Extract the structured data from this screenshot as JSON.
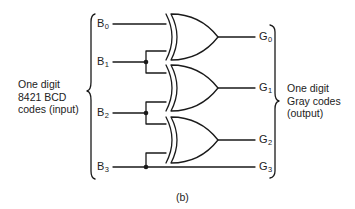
{
  "diagram": {
    "caption": "(b)",
    "input_group": {
      "lines": [
        "One digit",
        "8421 BCD",
        "codes (input)"
      ]
    },
    "output_group": {
      "lines": [
        "One digit",
        "Gray codes",
        "(output)"
      ]
    },
    "inputs": [
      {
        "name": "B",
        "sub": "0"
      },
      {
        "name": "B",
        "sub": "1"
      },
      {
        "name": "B",
        "sub": "2"
      },
      {
        "name": "B",
        "sub": "3"
      }
    ],
    "outputs": [
      {
        "name": "G",
        "sub": "0"
      },
      {
        "name": "G",
        "sub": "1"
      },
      {
        "name": "G",
        "sub": "2"
      },
      {
        "name": "G",
        "sub": "3"
      }
    ],
    "gates": [
      {
        "type": "XOR",
        "inputs": [
          "B0",
          "B1"
        ],
        "output": "G0"
      },
      {
        "type": "XOR",
        "inputs": [
          "B1",
          "B2"
        ],
        "output": "G1"
      },
      {
        "type": "XOR",
        "inputs": [
          "B2",
          "B3"
        ],
        "output": "G2"
      }
    ],
    "passthrough": {
      "from": "B3",
      "to": "G3"
    },
    "line_color": "#1a1a1a"
  }
}
